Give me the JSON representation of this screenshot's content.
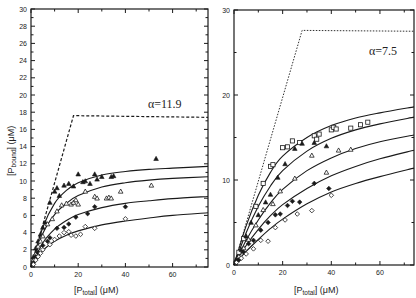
{
  "chart_data": [
    {
      "type": "scatter",
      "panel": "left",
      "title": "",
      "annotation": "α=11.9",
      "xlabel": "[P_total] (μM)",
      "ylabel": "[P_bound] (μM)",
      "xlim": [
        0,
        75
      ],
      "ylim": [
        0,
        30
      ],
      "xticks": [
        0,
        20,
        40,
        60
      ],
      "yticks": [
        0,
        2,
        4,
        6,
        8,
        10,
        12,
        14,
        16,
        18,
        20,
        22,
        24,
        26,
        28,
        30
      ],
      "grid": false,
      "legend": null,
      "saturation_bound": {
        "style": "dashed",
        "x": [
          0,
          18,
          75
        ],
        "y": [
          0,
          17.6,
          17.4
        ]
      },
      "fit_curves": [
        {
          "name": "filled-triangle fit",
          "x": [
            0,
            5,
            10,
            15,
            20,
            30,
            40,
            50,
            60,
            75
          ],
          "y": [
            0,
            4.6,
            7.4,
            8.9,
            9.8,
            10.7,
            11.1,
            11.35,
            11.5,
            11.7
          ]
        },
        {
          "name": "open-triangle fit",
          "x": [
            0,
            5,
            10,
            15,
            20,
            30,
            40,
            50,
            60,
            75
          ],
          "y": [
            0,
            3.9,
            6.1,
            7.4,
            8.3,
            9.3,
            9.8,
            10.1,
            10.3,
            10.5
          ]
        },
        {
          "name": "filled-diamond fit",
          "x": [
            0,
            5,
            10,
            15,
            20,
            30,
            40,
            50,
            60,
            75
          ],
          "y": [
            0,
            2.8,
            4.4,
            5.4,
            6.1,
            6.9,
            7.4,
            7.7,
            7.95,
            8.2
          ]
        },
        {
          "name": "open-diamond fit",
          "x": [
            0,
            5,
            10,
            15,
            20,
            30,
            40,
            50,
            60,
            75
          ],
          "y": [
            0,
            1.9,
            3.0,
            3.7,
            4.2,
            4.9,
            5.35,
            5.7,
            6.0,
            6.3
          ]
        }
      ],
      "series": [
        {
          "name": "filled triangles",
          "marker": "triangle-filled",
          "x": [
            1,
            2,
            3,
            4,
            5,
            6,
            8,
            10,
            11,
            12,
            14,
            16,
            18,
            20,
            22,
            23,
            25,
            27,
            28,
            30,
            34,
            35,
            53
          ],
          "y": [
            1.2,
            2.2,
            3.0,
            3.8,
            4.6,
            5.2,
            7.5,
            8.8,
            9.2,
            8.3,
            9.5,
            9.7,
            9.4,
            10.8,
            9.9,
            10.0,
            9.7,
            10.8,
            10.2,
            10.5,
            10.5,
            10.6,
            12.6
          ]
        },
        {
          "name": "open triangles",
          "marker": "triangle-open",
          "x": [
            1,
            2,
            3,
            4,
            5,
            7,
            9,
            11,
            13,
            15,
            17,
            18,
            19,
            20,
            23,
            27,
            28,
            32,
            33,
            34,
            38,
            51
          ],
          "y": [
            0.8,
            1.5,
            2.4,
            3.0,
            3.6,
            5.0,
            5.6,
            6.5,
            7.2,
            7.4,
            7.3,
            7.5,
            7.8,
            7.3,
            8.8,
            8.2,
            8.0,
            8.0,
            8.1,
            8.0,
            8.8,
            9.5
          ]
        },
        {
          "name": "filled diamonds",
          "marker": "diamond-filled",
          "x": [
            1,
            2,
            3,
            5,
            7,
            8,
            11,
            14,
            16,
            19,
            24,
            27,
            40
          ],
          "y": [
            0.5,
            1.2,
            1.7,
            2.5,
            3.0,
            3.4,
            4.5,
            4.6,
            5.0,
            5.8,
            6.2,
            7.0,
            7.0
          ]
        },
        {
          "name": "open diamonds",
          "marker": "diamond-open",
          "x": [
            1,
            2,
            3,
            4,
            5,
            8,
            10,
            12,
            14,
            16,
            17,
            19,
            21,
            23,
            27,
            40
          ],
          "y": [
            0.3,
            0.8,
            1.2,
            1.6,
            2.0,
            2.6,
            3.2,
            3.6,
            4.0,
            4.1,
            3.7,
            3.6,
            3.8,
            4.7,
            4.5,
            5.6
          ]
        }
      ]
    },
    {
      "type": "scatter",
      "panel": "right",
      "title": "",
      "annotation": "α=7.5",
      "xlabel": "[P_total] (μM)",
      "ylabel": "",
      "xlim": [
        0,
        74
      ],
      "ylim": [
        0,
        30
      ],
      "xticks": [
        0,
        20,
        40,
        60
      ],
      "yticks": [
        0,
        10,
        20,
        30
      ],
      "grid": false,
      "legend": null,
      "saturation_bound": {
        "style": "dotted",
        "x": [
          0,
          28,
          74
        ],
        "y": [
          0,
          27.6,
          27.5
        ]
      },
      "fit_curves": [
        {
          "name": "open-square fit",
          "x": [
            0,
            5,
            10,
            15,
            20,
            30,
            40,
            50,
            60,
            74
          ],
          "y": [
            0,
            4.6,
            8.2,
            10.9,
            12.8,
            15.0,
            16.4,
            17.3,
            17.9,
            18.6
          ]
        },
        {
          "name": "filled-triangle fit",
          "x": [
            0,
            5,
            10,
            15,
            20,
            30,
            40,
            50,
            60,
            74
          ],
          "y": [
            0,
            3.8,
            6.9,
            9.3,
            11.1,
            13.4,
            14.9,
            15.9,
            16.6,
            17.4
          ]
        },
        {
          "name": "open-triangle fit",
          "x": [
            0,
            5,
            10,
            15,
            20,
            30,
            40,
            50,
            60,
            74
          ],
          "y": [
            0,
            2.9,
            5.3,
            7.3,
            8.9,
            11.1,
            12.6,
            13.7,
            14.5,
            15.3
          ]
        },
        {
          "name": "filled-diamond fit",
          "x": [
            0,
            5,
            10,
            15,
            20,
            30,
            40,
            50,
            60,
            74
          ],
          "y": [
            0,
            2.3,
            4.2,
            5.8,
            7.1,
            9.0,
            10.5,
            11.6,
            12.5,
            13.5
          ]
        },
        {
          "name": "open-diamond fit",
          "x": [
            0,
            5,
            10,
            15,
            20,
            30,
            40,
            50,
            60,
            74
          ],
          "y": [
            0,
            1.6,
            3.0,
            4.3,
            5.4,
            7.2,
            8.6,
            9.6,
            10.4,
            11.4
          ]
        }
      ],
      "series": [
        {
          "name": "open squares",
          "marker": "square-open",
          "x": [
            2,
            4,
            9,
            12,
            15,
            16,
            20,
            22,
            24,
            27,
            33,
            34,
            35,
            40,
            41,
            42,
            48,
            52,
            55
          ],
          "y": [
            1.5,
            3.1,
            6.9,
            9.6,
            11.6,
            11.8,
            13.8,
            13.9,
            14.6,
            14.4,
            15.2,
            14.8,
            15.4,
            15.9,
            16.2,
            16.0,
            16.1,
            16.5,
            16.8
          ]
        },
        {
          "name": "filled triangles",
          "marker": "triangle-filled",
          "x": [
            1,
            3,
            5,
            7,
            10,
            13,
            15,
            18,
            21,
            25,
            28,
            33,
            38
          ],
          "y": [
            0.7,
            1.8,
            3.4,
            5.0,
            5.9,
            7.4,
            8.3,
            10.3,
            11.9,
            13.7,
            14.3,
            14.4,
            14.0
          ]
        },
        {
          "name": "open triangles",
          "marker": "triangle-open",
          "x": [
            2,
            4,
            6,
            9,
            12,
            16,
            19,
            25,
            32,
            38,
            43,
            48
          ],
          "y": [
            1.0,
            2.0,
            3.0,
            4.7,
            6.5,
            7.2,
            8.7,
            10.2,
            12.9,
            10.9,
            13.5,
            13.6
          ]
        },
        {
          "name": "filled diamonds",
          "marker": "diamond-filled",
          "x": [
            2,
            4,
            6,
            8,
            11,
            14,
            17,
            19,
            22,
            24,
            27,
            33,
            39
          ],
          "y": [
            0.6,
            1.5,
            2.5,
            2.9,
            4.1,
            5.0,
            5.9,
            6.0,
            7.0,
            7.5,
            7.4,
            9.6,
            9.0
          ]
        },
        {
          "name": "open diamonds",
          "marker": "diamond-open",
          "x": [
            1,
            3,
            5,
            8,
            11,
            14,
            17,
            21,
            26,
            32,
            40
          ],
          "y": [
            0.3,
            0.8,
            1.3,
            1.9,
            2.9,
            2.8,
            4.4,
            5.3,
            6.0,
            6.4,
            8.2
          ]
        }
      ]
    }
  ],
  "labels": {
    "left_ylabel_main": "[P",
    "left_ylabel_sub": "bound",
    "left_ylabel_tail": "] (μM)",
    "xlabel_main": "[P",
    "xlabel_sub": "total",
    "xlabel_tail": "] (μM)",
    "left_annotation": "α=11.9",
    "right_annotation": "α=7.5"
  }
}
